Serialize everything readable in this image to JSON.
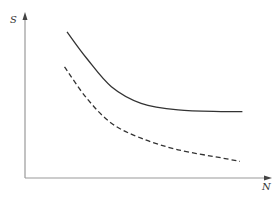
{
  "chart_data": {
    "type": "line",
    "title": "",
    "xlabel": "N",
    "ylabel": "S",
    "grid": false,
    "legend": null,
    "ticks": {
      "x": [],
      "y": []
    },
    "series": [
      {
        "name": "upper curve",
        "style": "solid",
        "color": "#333333",
        "x": [
          0.17,
          0.25,
          0.35,
          0.47,
          0.62,
          0.8,
          0.88
        ],
        "y": [
          0.88,
          0.72,
          0.55,
          0.45,
          0.41,
          0.4,
          0.4
        ]
      },
      {
        "name": "lower curve",
        "style": "dashed",
        "color": "#333333",
        "x": [
          0.16,
          0.25,
          0.35,
          0.47,
          0.62,
          0.8,
          0.87
        ],
        "y": [
          0.67,
          0.48,
          0.33,
          0.24,
          0.17,
          0.12,
          0.1
        ]
      }
    ],
    "axis_color": "#999999"
  },
  "axes": {
    "x_label": "N",
    "y_label": "S"
  }
}
